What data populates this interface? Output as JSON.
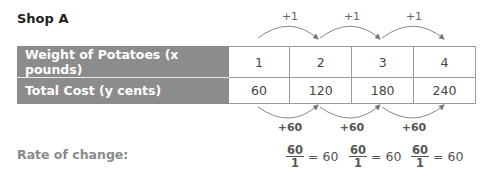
{
  "title": "Shop A",
  "table": {
    "rows": [
      {
        "header": "Weight of Potatoes (x pounds)",
        "values": [
          "1",
          "2",
          "3",
          "4"
        ]
      },
      {
        "header": "Total Cost (y cents)",
        "values": [
          "60",
          "120",
          "180",
          "240"
        ]
      }
    ]
  },
  "top_arrows": [
    "+1",
    "+1",
    "+1"
  ],
  "bottom_arrows": [
    "+60",
    "+60",
    "+60"
  ],
  "rate": {
    "label": "Rate of change:",
    "fractions": [
      {
        "numerator": "60",
        "denominator": "1",
        "result": "= 60"
      },
      {
        "numerator": "60",
        "denominator": "1",
        "result": "= 60"
      },
      {
        "numerator": "60",
        "denominator": "1",
        "result": "= 60"
      }
    ]
  },
  "colors": {
    "header_bg": "#8c8c8c",
    "arrow": "#777777"
  }
}
